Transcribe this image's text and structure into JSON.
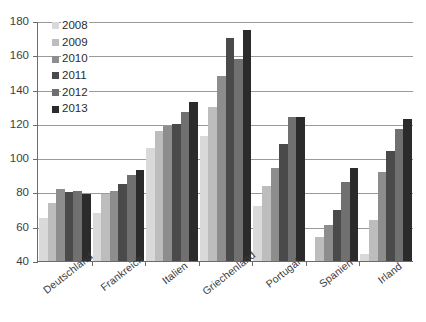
{
  "chart_data": {
    "type": "bar",
    "title": "",
    "subtitle": "",
    "xlabel": "",
    "ylabel": "",
    "ylim": [
      40,
      180
    ],
    "ytick_step": 20,
    "yticks": [
      40,
      60,
      80,
      100,
      120,
      140,
      160,
      180
    ],
    "grid": true,
    "legend_position": "top-left inside plot",
    "categories": [
      "Deutschland",
      "Frankreich",
      "Italien",
      "Griechenland",
      "Portugal",
      "Spanien",
      "Irland"
    ],
    "series": [
      {
        "name": "2008",
        "color": "#d9d9d9",
        "values": [
          65,
          68,
          106,
          113,
          72,
          40,
          44
        ]
      },
      {
        "name": "2009",
        "color": "#bdbdbd",
        "values": [
          74,
          79,
          116,
          130,
          84,
          54,
          64
        ]
      },
      {
        "name": "2010",
        "color": "#8d8d8d",
        "values": [
          82,
          81,
          119,
          148,
          94,
          61,
          92
        ]
      },
      {
        "name": "2011",
        "color": "#4a4a4a",
        "values": [
          80,
          85,
          120,
          170,
          108,
          70,
          104
        ]
      },
      {
        "name": "2012",
        "color": "#707070",
        "values": [
          81,
          90,
          127,
          158,
          124,
          86,
          117
        ]
      },
      {
        "name": "2013",
        "color": "#2b2b2b",
        "values": [
          79,
          93,
          133,
          175,
          124,
          94,
          123
        ]
      }
    ]
  },
  "legend": {
    "items": [
      {
        "label": "2008"
      },
      {
        "label": "2009"
      },
      {
        "label": "2010"
      },
      {
        "label": "2011"
      },
      {
        "label": "2012"
      },
      {
        "label": "2013"
      }
    ]
  },
  "axis": {
    "y_tick_labels": [
      "180",
      "160",
      "140",
      "120",
      "100",
      "80",
      "60",
      "40"
    ]
  }
}
